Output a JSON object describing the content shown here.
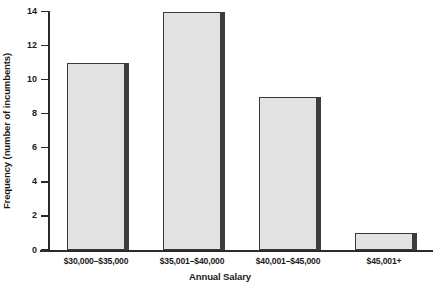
{
  "chart_data": {
    "type": "bar",
    "title": "",
    "subtitle": "",
    "xlabel": "Annual Salary",
    "ylabel": "Frequency (number of incumbents)",
    "categories": [
      "$30,000–$35,000",
      "$35,001–$40,000",
      "$40,001–$45,000",
      "$45,001+"
    ],
    "values": [
      11,
      14,
      9,
      1
    ],
    "ylim": [
      0,
      14
    ],
    "yticks": [
      0,
      2,
      4,
      6,
      8,
      10,
      12,
      14
    ],
    "ytick_labels": [
      "0",
      "2",
      "4",
      "6",
      "8",
      "10",
      "12",
      "14"
    ],
    "grid": false,
    "legend": null,
    "bar_fill_color": "#e3e3e3",
    "bar_border_color": "#3a3a3a",
    "bar_shadow_color": "#3d3d3d",
    "axis_color": "#2b2b2b",
    "background_color": "#ffffff"
  }
}
